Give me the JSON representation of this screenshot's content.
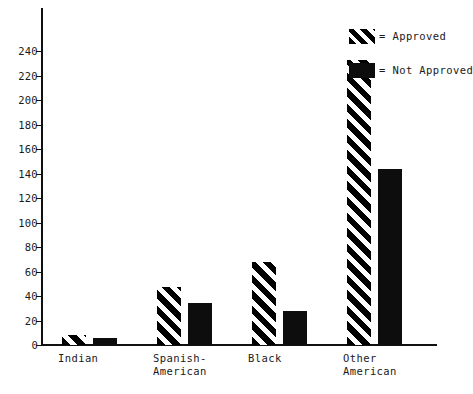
{
  "chart_data": {
    "type": "bar",
    "title": "",
    "subtitle": "",
    "xlabel": "",
    "ylabel": "",
    "categories": [
      "Indian",
      "Spanish-\nAmerican",
      "Black",
      "Other\nAmerican"
    ],
    "series": [
      {
        "name": "Approved",
        "values": [
          8,
          47,
          68,
          233
        ],
        "fill": "diagonal-hatch"
      },
      {
        "name": "Not Approved",
        "values": [
          6,
          34,
          28,
          144
        ],
        "fill": "solid-black"
      }
    ],
    "ylim": [
      0,
      250
    ],
    "yticks": [
      0,
      20,
      40,
      60,
      80,
      100,
      120,
      140,
      160,
      180,
      200,
      220,
      240
    ],
    "ytick_labels": [
      "0",
      "20",
      "40",
      "60",
      "80",
      "100",
      "120",
      "140",
      "160",
      "180",
      "200",
      "220",
      "240"
    ],
    "grid": false,
    "legend_position": "top-right",
    "colors": {
      "ink": "#111111",
      "bar_solid": "#0d0d0d",
      "background": "#ffffff"
    }
  },
  "legend": {
    "items": [
      {
        "label": "= Approved",
        "swatch": "hatched-swatch"
      },
      {
        "label": "= Not Approved",
        "swatch": "solid-swatch"
      }
    ]
  }
}
